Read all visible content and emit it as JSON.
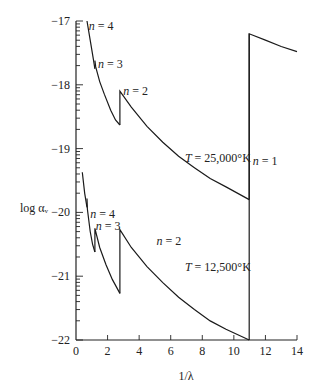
{
  "chart_data": {
    "type": "line",
    "title": "",
    "xlabel": "1/λ",
    "ylabel": "log αᵥ",
    "xlim": [
      0,
      14
    ],
    "ylim": [
      -22,
      -17
    ],
    "grid": false,
    "x_ticks": [
      0,
      2,
      4,
      6,
      8,
      10,
      12,
      14
    ],
    "x_tick_labels": [
      "0",
      "2",
      "4",
      "6",
      "8",
      "10",
      "12",
      "14"
    ],
    "y_ticks": [
      -17,
      -18,
      -19,
      -20,
      -21,
      -22
    ],
    "y_tick_labels": [
      "−17",
      "−18",
      "−19",
      "−20",
      "−21",
      "−22"
    ],
    "series": [
      {
        "name": "T = 25,000°K",
        "segments": [
          {
            "x": [
              0.7,
              0.9,
              1.1,
              1.2
            ],
            "y": [
              -17.0,
              -17.3,
              -17.6,
              -17.75
            ]
          },
          {
            "x": [
              1.2,
              1.25,
              1.5,
              1.8,
              2.2,
              2.5,
              2.78
            ],
            "y": [
              -17.62,
              -17.72,
              -17.95,
              -18.15,
              -18.4,
              -18.55,
              -18.63
            ]
          },
          {
            "x": [
              2.78,
              2.78,
              3.5,
              4.5,
              5.5,
              6.5,
              7.5,
              8.5,
              9.5,
              10.97
            ],
            "y": [
              -18.63,
              -18.1,
              -18.35,
              -18.65,
              -18.9,
              -19.12,
              -19.3,
              -19.47,
              -19.6,
              -19.8
            ]
          },
          {
            "x": [
              10.97,
              10.97,
              12.0,
              13.0,
              14.0
            ],
            "y": [
              -19.8,
              -17.2,
              -17.3,
              -17.4,
              -17.48
            ]
          }
        ],
        "edges": [
          {
            "label": "n = 4",
            "x": 0.7
          },
          {
            "label": "n = 3",
            "x": 1.2
          },
          {
            "label": "n = 2",
            "x": 2.78
          },
          {
            "label": "n = 1",
            "x": 10.97
          }
        ]
      },
      {
        "name": "T = 12,500°K",
        "segments": [
          {
            "x": [
              0.4,
              0.55,
              0.7
            ],
            "y": [
              -19.37,
              -19.7,
              -19.92
            ]
          },
          {
            "x": [
              0.7,
              0.72,
              0.9,
              1.05,
              1.2
            ],
            "y": [
              -19.78,
              -19.95,
              -20.3,
              -20.5,
              -20.62
            ]
          },
          {
            "x": [
              1.2,
              1.2,
              1.5,
              1.9,
              2.3,
              2.78
            ],
            "y": [
              -20.62,
              -20.25,
              -20.55,
              -20.82,
              -21.05,
              -21.27
            ]
          },
          {
            "x": [
              2.78,
              2.78,
              3.5,
              4.5,
              5.5,
              6.5,
              7.5,
              8.5,
              9.5,
              10.97
            ],
            "y": [
              -21.27,
              -20.27,
              -20.55,
              -20.85,
              -21.1,
              -21.33,
              -21.52,
              -21.7,
              -21.83,
              -22.0
            ]
          },
          {
            "x": [
              10.97,
              10.97
            ],
            "y": [
              -22.0,
              -17.2
            ]
          }
        ],
        "edges": [
          {
            "label": "n = 4",
            "x": 0.7
          },
          {
            "label": "n = 3",
            "x": 1.2
          },
          {
            "label": "n = 2",
            "x": 2.78
          }
        ]
      }
    ],
    "annotations": [
      {
        "text": "n = 4",
        "x": 0.8,
        "y": -17.08
      },
      {
        "text": "n = 3",
        "x": 1.4,
        "y": -17.68
      },
      {
        "text": "n = 2",
        "x": 3.0,
        "y": -18.1
      },
      {
        "text": "T = 25,000°K",
        "x": 6.9,
        "y": -19.15
      },
      {
        "text": "n = 1",
        "x": 11.2,
        "y": -19.2
      },
      {
        "text": "n = 4",
        "x": 0.9,
        "y": -20.03
      },
      {
        "text": "n = 3",
        "x": 1.25,
        "y": -20.21
      },
      {
        "text": "n = 2",
        "x": 5.1,
        "y": -20.45
      },
      {
        "text": "T = 12,500°K",
        "x": 6.9,
        "y": -20.85
      }
    ]
  }
}
